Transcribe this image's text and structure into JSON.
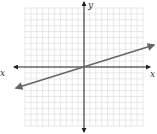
{
  "chart_data": {
    "type": "line",
    "title": "",
    "xlabel": "x",
    "ylabel": "y",
    "xlim": [
      -10,
      10
    ],
    "ylim": [
      -10,
      10
    ],
    "grid": true,
    "series": [
      {
        "name": "line",
        "x": [
          -10,
          10
        ],
        "y": [
          -3.33,
          3.33
        ],
        "slope": 0.333,
        "intercept": 0
      }
    ]
  },
  "axes": {
    "x_label": "x",
    "y_label": "y"
  },
  "colors": {
    "grid": "#d9d9d9",
    "axis": "#222222",
    "line": "#666666"
  }
}
